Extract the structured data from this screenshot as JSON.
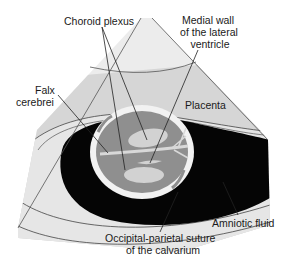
{
  "diagram": {
    "type": "ultrasound-schematic",
    "labels": {
      "choroid_plexus": "Choroid plexus",
      "medial_wall_line1": "Medial wall",
      "medial_wall_line2": "of the lateral",
      "medial_wall_line3": "ventricle",
      "falx_line1": "Falx",
      "falx_line2": "cerebrei",
      "placenta": "Placenta",
      "amniotic_fluid": "Amniotic fluid",
      "suture_line1": "Occipital-parietal suture",
      "suture_line2": "of the calvarium"
    },
    "colors": {
      "background": "#ffffff",
      "near_field": "#ececec",
      "placenta": "#d6d6d6",
      "uterine_wall": "#e4e4e4",
      "amniotic_fluid": "#050505",
      "calvarium": "#f2f2f2",
      "brain": "#8f8f8f",
      "ventricle": "#d0d0d0",
      "outline": "#333333"
    }
  }
}
